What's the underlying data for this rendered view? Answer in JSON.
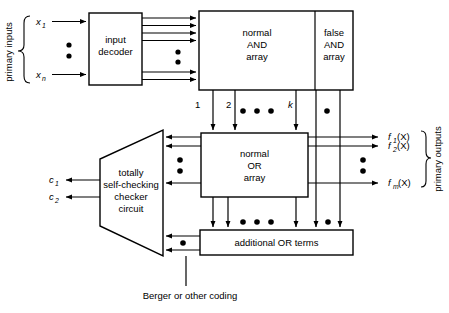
{
  "figure": {
    "type": "block-diagram"
  },
  "left_labels": {
    "primary_inputs": "primary inputs",
    "input_first": "x",
    "input_first_sub": "1",
    "input_last": "x",
    "input_last_sub": "n"
  },
  "blocks": {
    "input_decoder": {
      "line1": "input",
      "line2": "decoder"
    },
    "normal_and": {
      "line1": "normal",
      "line2": "AND",
      "line3": "array"
    },
    "false_and": {
      "line1": "false",
      "line2": "AND",
      "line3": "array"
    },
    "normal_or": {
      "line1": "normal",
      "line2": "OR",
      "line3": "array"
    },
    "additional_or": {
      "label": "additional OR terms"
    },
    "checker": {
      "line1": "totally",
      "line2": "self-checking",
      "line3": "checker",
      "line4": "circuit"
    }
  },
  "product_terms": {
    "first": "1",
    "second": "2",
    "last": "k"
  },
  "checker_outputs": {
    "c1": "c",
    "c1_sub": "1",
    "c2": "c",
    "c2_sub": "2"
  },
  "outputs": {
    "primary_outputs": "primary outputs",
    "f1": "f",
    "f1_sub": "1",
    "f1_arg": "(X)",
    "f2": "f",
    "f2_sub": "2",
    "f2_arg": "(X)",
    "fm": "f",
    "fm_sub": "m",
    "fm_arg": "(X)"
  },
  "annotation": {
    "coding": "Berger or other coding"
  },
  "colors": {
    "stroke": "#000000",
    "background": "#ffffff",
    "fill": "#ffffff"
  }
}
